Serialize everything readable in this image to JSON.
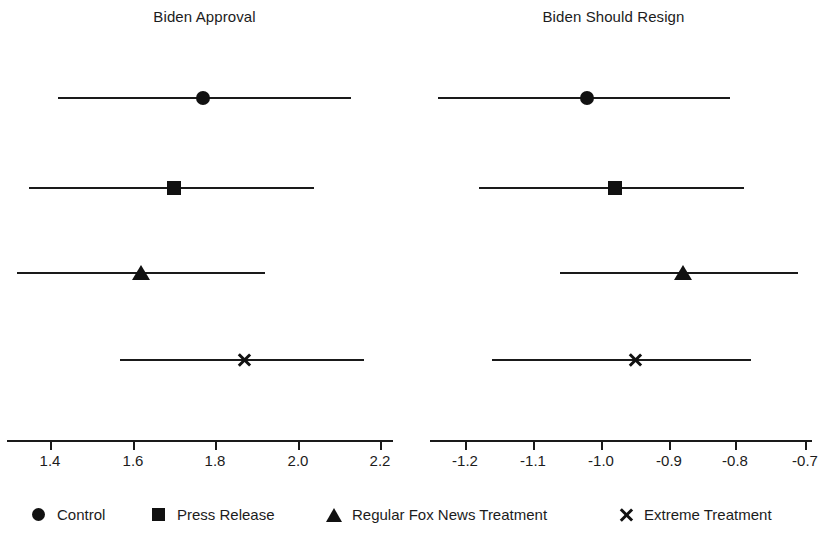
{
  "chart_data": {
    "type": "scatter",
    "subtype": "coefficient-plot-with-confidence-intervals",
    "title": "",
    "grid": false,
    "legend_position": "bottom",
    "panels": [
      {
        "title": "Biden Approval",
        "xlabel": "",
        "ylabel": "",
        "xlim": [
          1.3,
          2.22
        ],
        "xticks": [
          1.4,
          1.6,
          1.8,
          2.0,
          2.2
        ],
        "xtick_labels": [
          "1.4",
          "1.6",
          "1.8",
          "2.0",
          "2.2"
        ],
        "points": [
          {
            "group": "Control",
            "marker": "circle",
            "estimate": 1.77,
            "ci_low": 1.42,
            "ci_high": 2.13
          },
          {
            "group": "Press Release",
            "marker": "square",
            "estimate": 1.7,
            "ci_low": 1.35,
            "ci_high": 2.04
          },
          {
            "group": "Regular Fox News Treatment",
            "marker": "triangle",
            "estimate": 1.62,
            "ci_low": 1.32,
            "ci_high": 1.92
          },
          {
            "group": "Extreme Treatment",
            "marker": "cross",
            "estimate": 1.87,
            "ci_low": 1.57,
            "ci_high": 2.16
          }
        ]
      },
      {
        "title": "Biden Should Resign",
        "xlabel": "",
        "ylabel": "",
        "xlim": [
          -1.25,
          -0.69
        ],
        "xticks": [
          -1.2,
          -1.1,
          -1.0,
          -0.9,
          -0.8,
          -0.7
        ],
        "xtick_labels": [
          "-1.2",
          "-1.1",
          "-1.0",
          "-0.9",
          "-0.8",
          "-0.7"
        ],
        "points": [
          {
            "group": "Control",
            "marker": "circle",
            "estimate": -1.02,
            "ci_low": -1.24,
            "ci_high": -0.81
          },
          {
            "group": "Press Release",
            "marker": "square",
            "estimate": -0.98,
            "ci_low": -1.18,
            "ci_high": -0.79
          },
          {
            "group": "Regular Fox News Treatment",
            "marker": "triangle",
            "estimate": -0.88,
            "ci_low": -1.06,
            "ci_high": -0.71
          },
          {
            "group": "Extreme Treatment",
            "marker": "cross",
            "estimate": -0.95,
            "ci_low": -1.16,
            "ci_high": -0.78
          }
        ]
      }
    ],
    "legend": [
      {
        "label": "Control",
        "marker": "circle"
      },
      {
        "label": "Press Release",
        "marker": "square"
      },
      {
        "label": "Regular Fox News Treatment",
        "marker": "triangle"
      },
      {
        "label": "Extreme Treatment",
        "marker": "cross"
      }
    ],
    "colors": {
      "marker": "#111111",
      "line": "#1a1a1a",
      "text": "#1c1c1c",
      "background": "#ffffff"
    }
  },
  "layout": {
    "panel_pixel_width": 409,
    "row_y_centers": [
      98,
      188,
      273,
      360
    ],
    "axis_y": 440,
    "panel_axis": [
      {
        "axis_left": 7,
        "axis_right": 393,
        "tick_px": [
          50,
          133,
          215,
          298,
          380
        ]
      },
      {
        "axis_left": 430,
        "axis_right": 812,
        "tick_px": [
          465,
          533,
          601,
          669,
          735,
          805
        ]
      }
    ]
  }
}
